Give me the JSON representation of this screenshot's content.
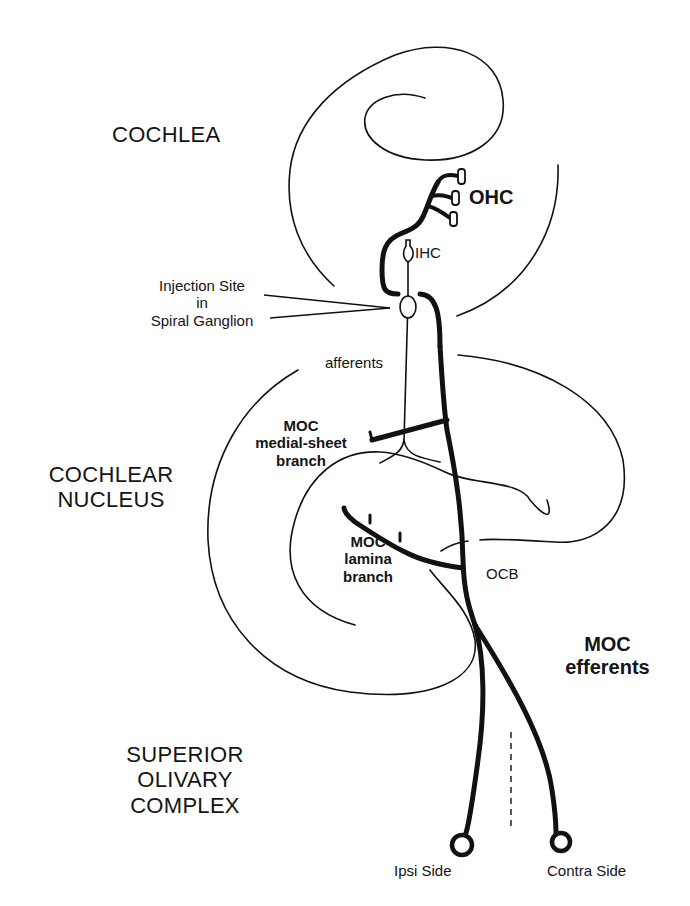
{
  "diagram": {
    "regions": {
      "cochlea": "COCHLEA",
      "cochlear_nucleus_line1": "COCHLEAR",
      "cochlear_nucleus_line2": "NUCLEUS",
      "soc_line1": "SUPERIOR",
      "soc_line2": "OLIVARY",
      "soc_line3": "COMPLEX"
    },
    "labels": {
      "ohc": "OHC",
      "ihc": "IHC",
      "injection_line1": "Injection Site",
      "injection_line2": "in",
      "injection_line3": "Spiral Ganglion",
      "afferents": "afferents",
      "medial_sheet_line1": "MOC",
      "medial_sheet_line2": "medial-sheet",
      "medial_sheet_line3": "branch",
      "lamina_line1": "MOC",
      "lamina_line2": "lamina",
      "lamina_line3": "branch",
      "ocb": "OCB",
      "moc_efferents_line1": "MOC",
      "moc_efferents_line2": "efferents",
      "ipsi_side": "Ipsi Side",
      "contra_side": "Contra Side"
    },
    "colors": {
      "ink": "#111111",
      "background": "#ffffff"
    }
  }
}
